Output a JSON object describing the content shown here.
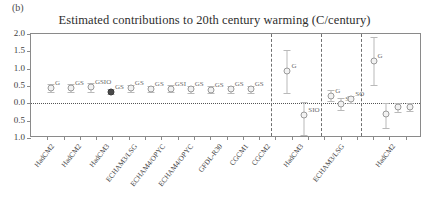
{
  "figure": {
    "panel_label": "(b)",
    "title": "Estimated contributions to 20th century warming (C/century)"
  },
  "chart_data": {
    "type": "scatter",
    "title": "Estimated contributions to 20th century warming (C/century)",
    "xlabel": "",
    "ylabel": "",
    "ylim": [
      -1.0,
      2.0
    ],
    "yticks": [
      2.0,
      1.5,
      1.0,
      0.5,
      0.0,
      -0.5,
      -1.0
    ],
    "ytick_labels": [
      "2.0",
      "1.5",
      "1.0",
      "0.5",
      "0.0",
      "0.5",
      "1.0"
    ],
    "grid": false,
    "legend": "none",
    "zero_reference_line": 0.0,
    "group_dividers_after": [
      "CGCM2",
      "HadCM3",
      "ECHAM3/LSG"
    ],
    "categories": [
      "HadCM2",
      "HadCM2",
      "HadCM3",
      "ECHAM3/LSG",
      "ECHAM4/OPYC",
      "ECHAM4/OPYC",
      "GFDL-R30",
      "CGCM1",
      "CGCM2",
      "HadCM3",
      "ECHAM3/LSG",
      "HadCM2"
    ],
    "groups": [
      {
        "name": "greenhouse-gas-contributions",
        "points": [
          {
            "x": "HadCM2",
            "value": 0.45,
            "lower": 0.34,
            "upper": 0.56,
            "label": "G"
          },
          {
            "x": "HadCM2",
            "value": 0.44,
            "lower": 0.33,
            "upper": 0.55,
            "label": "GS"
          },
          {
            "x": "HadCM3",
            "value": 0.46,
            "lower": 0.33,
            "upper": 0.59,
            "label": "GSIO"
          },
          {
            "x": "ECHAM3/LSG",
            "value": 0.34,
            "lower": 0.26,
            "upper": 0.42,
            "label": "GS",
            "filled": true
          },
          {
            "x": "ECHAM4/OPYC",
            "value": 0.43,
            "lower": 0.33,
            "upper": 0.53,
            "label": "GS"
          },
          {
            "x": "ECHAM4/OPYC",
            "value": 0.42,
            "lower": 0.33,
            "upper": 0.51,
            "label": "GS"
          },
          {
            "x": "GFDL-R30",
            "value": 0.42,
            "lower": 0.32,
            "upper": 0.52,
            "label": "GSI"
          },
          {
            "x": "CGCM1",
            "value": 0.4,
            "lower": 0.3,
            "upper": 0.5,
            "label": "GS"
          },
          {
            "x": "CGCM2",
            "value": 0.39,
            "lower": 0.29,
            "upper": 0.49,
            "label": "GS"
          },
          {
            "x": "CGCM2b",
            "value": 0.4,
            "lower": 0.3,
            "upper": 0.5,
            "label": "GS"
          },
          {
            "x": "CGCM2c",
            "value": 0.4,
            "lower": 0.3,
            "upper": 0.5,
            "label": "GS"
          }
        ]
      },
      {
        "name": "HadCM3",
        "points": [
          {
            "x": "HadCM3-G",
            "value": 0.92,
            "lower": 0.3,
            "upper": 1.55,
            "label": "G"
          },
          {
            "x": "HadCM3-SIO",
            "value": -0.35,
            "lower": -0.92,
            "upper": 0.03,
            "label": "SIO"
          }
        ]
      },
      {
        "name": "ECHAM3/LSG",
        "points": [
          {
            "x": "ECHAM3-G",
            "value": 0.22,
            "lower": 0.06,
            "upper": 0.38,
            "label": "G"
          },
          {
            "x": "ECHAM3-S",
            "value": -0.02,
            "lower": -0.18,
            "upper": 0.14,
            "label": "S"
          },
          {
            "x": "ECHAM3-SO",
            "value": 0.12,
            "lower": 0.02,
            "upper": 0.22,
            "label": "SO"
          }
        ]
      },
      {
        "name": "HadCM2",
        "points": [
          {
            "x": "HadCM2-G",
            "value": 1.22,
            "lower": 0.52,
            "upper": 1.92,
            "label": "G"
          },
          {
            "x": "HadCM2-S1",
            "value": -0.3,
            "lower": -0.72,
            "upper": 0.02,
            "label": ""
          },
          {
            "x": "HadCM2-S2",
            "value": -0.12,
            "lower": -0.24,
            "upper": 0.01,
            "label": ""
          },
          {
            "x": "HadCM2-S3",
            "value": -0.1,
            "lower": -0.22,
            "upper": 0.02,
            "label": ""
          }
        ]
      }
    ]
  },
  "colors": {
    "axis": "#8a8a8a",
    "marker": "#9a9a9a",
    "text": "#3d3d3d"
  }
}
